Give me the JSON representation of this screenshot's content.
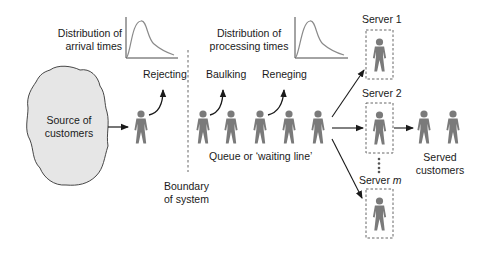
{
  "diagram": {
    "colors": {
      "person": "#7a7a7a",
      "blob_fill": "#e6e6e6",
      "line": "#1a1a1a",
      "dashed": "#555555",
      "curve": "#8a8a8a"
    },
    "source": {
      "line1": "Source of",
      "line2": "customers"
    },
    "arrival_distribution": {
      "line1": "Distribution of",
      "line2": "arrival times"
    },
    "processing_distribution": {
      "line1": "Distribution of",
      "line2": "processing times"
    },
    "rejecting": "Rejecting",
    "baulking": "Baulking",
    "reneging": "Reneging",
    "queue_label": "Queue or ‘waiting line’",
    "boundary": {
      "line1": "Boundary",
      "line2": "of system"
    },
    "servers": [
      {
        "label": "Server 1"
      },
      {
        "label": "Server 2"
      },
      {
        "label_prefix": "Server ",
        "label_var": "m"
      }
    ],
    "served": {
      "line1": "Served",
      "line2": "customers"
    },
    "queue_count": 5,
    "served_count": 2
  }
}
